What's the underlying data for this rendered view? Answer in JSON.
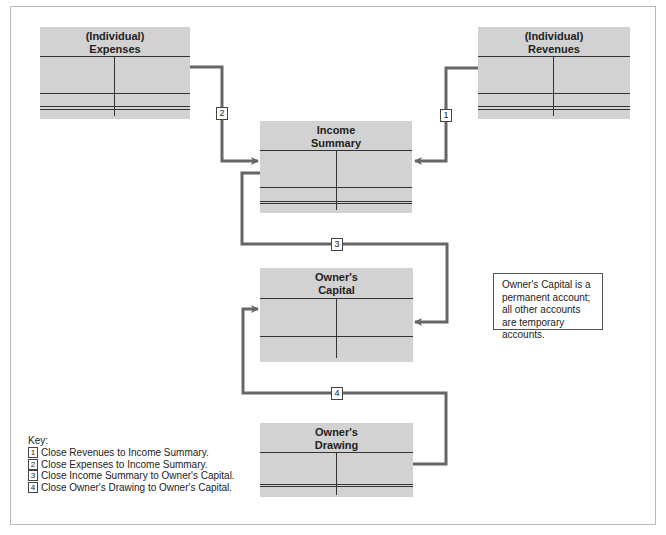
{
  "diagram": {
    "accounts": [
      {
        "id": "expenses",
        "title_line1": "(Individual)",
        "title_line2": "Expenses"
      },
      {
        "id": "revenues",
        "title_line1": "(Individual)",
        "title_line2": "Revenues"
      },
      {
        "id": "income_summary",
        "title_line1": "Income",
        "title_line2": "Summary"
      },
      {
        "id": "owners_capital",
        "title_line1": "Owner's",
        "title_line2": "Capital"
      },
      {
        "id": "owners_drawing",
        "title_line1": "Owner's",
        "title_line2": "Drawing"
      }
    ],
    "steps": [
      {
        "num": "1",
        "from": "Revenues",
        "to": "Income Summary"
      },
      {
        "num": "2",
        "from": "Expenses",
        "to": "Income Summary"
      },
      {
        "num": "3",
        "from": "Income Summary",
        "to": "Owner's Capital"
      },
      {
        "num": "4",
        "from": "Owner's Drawing",
        "to": "Owner's Capital"
      }
    ],
    "note": "Owner's Capital is a permanent account; all other accounts are temporary accounts.",
    "key": {
      "title": "Key:",
      "items": [
        {
          "num": "1",
          "text": "Close Revenues to Income Summary."
        },
        {
          "num": "2",
          "text": "Close Expenses to Income Summary."
        },
        {
          "num": "3",
          "text": "Close Income Summary to Owner's Capital."
        },
        {
          "num": "4",
          "text": "Close Owner's Drawing to Owner's Capital."
        }
      ]
    },
    "colors": {
      "account_fill": "#d2d2d2",
      "connector": "#666666",
      "rule": "#333333"
    }
  }
}
